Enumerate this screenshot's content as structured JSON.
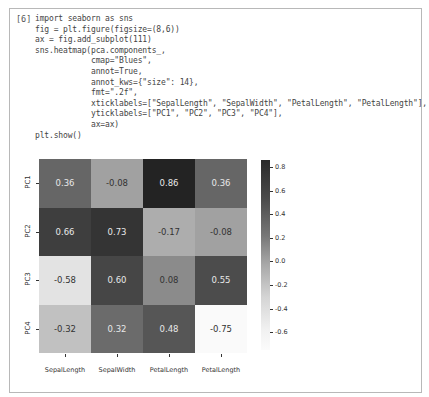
{
  "cell": {
    "prompt": "[6]",
    "code_lines": [
      "import seaborn as sns",
      "fig = plt.figure(figsize=(8,6))",
      "ax = fig.add_subplot(111)",
      "sns.heatmap(pca.components_,",
      "            cmap=\"Blues\",",
      "            annot=True,",
      "            annot_kws={\"size\": 14},",
      "            fmt=\".2f\",",
      "            xticklabels=[\"SepalLength\", \"SepalWidth\", \"PetalLength\", \"PetalLength\"],",
      "            yticklabels=[\"PC1\", \"PC2\", \"PC3\", \"PC4\"],",
      "            ax=ax)",
      "plt.show()"
    ]
  },
  "chart_data": {
    "type": "heatmap",
    "title": "",
    "xlabel": "",
    "ylabel": "",
    "x_categories": [
      "SepalLength",
      "SepalWidth",
      "PetalLength",
      "PetalLength"
    ],
    "y_categories": [
      "PC1",
      "PC2",
      "PC3",
      "PC4"
    ],
    "values": [
      [
        0.36,
        -0.08,
        0.86,
        0.36
      ],
      [
        0.66,
        0.73,
        -0.17,
        -0.08
      ],
      [
        -0.58,
        0.6,
        0.08,
        0.55
      ],
      [
        -0.32,
        0.32,
        0.48,
        -0.75
      ]
    ],
    "annotations": [
      [
        "0.36",
        "-0.08",
        "0.86",
        "0.36"
      ],
      [
        "0.66",
        "0.73",
        "-0.17",
        "-0.08"
      ],
      [
        "-0.58",
        "0.60",
        "0.08",
        "0.55"
      ],
      [
        "-0.32",
        "0.32",
        "0.48",
        "-0.75"
      ]
    ],
    "colormap": "Blues (rendered grayscale)",
    "colorbar": {
      "range": [
        -0.75,
        0.86
      ],
      "ticks": [
        "0.8",
        "0.6",
        "0.4",
        "0.2",
        "0.0",
        "-0.2",
        "-0.4",
        "-0.6"
      ]
    }
  }
}
